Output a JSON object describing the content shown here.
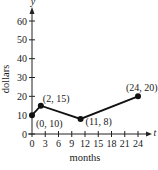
{
  "chart_data": {
    "type": "line",
    "title": "",
    "xlabel": "months",
    "ylabel": "dollars",
    "x_axis_var": "t",
    "y_axis_var": "y",
    "xlim": [
      0,
      24
    ],
    "ylim": [
      0,
      60
    ],
    "x_ticks": [
      0,
      3,
      6,
      9,
      12,
      15,
      18,
      21,
      24
    ],
    "y_ticks": [
      0,
      10,
      20,
      30,
      40,
      50,
      60
    ],
    "grid": false,
    "legend": null,
    "series": [
      {
        "name": "cost",
        "x": [
          0,
          2,
          11,
          24
        ],
        "y": [
          10,
          15,
          8,
          20
        ]
      }
    ],
    "annotations": [
      {
        "text": "(0, 10)",
        "x": 0,
        "y": 10
      },
      {
        "text": "(2, 15)",
        "x": 2,
        "y": 15
      },
      {
        "text": "(11, 8)",
        "x": 11,
        "y": 8
      },
      {
        "text": "(24, 20)",
        "x": 24,
        "y": 20
      }
    ],
    "x_tick_labels": [
      "0",
      "3",
      "6",
      "9",
      "12",
      "15",
      "18",
      "21",
      "24"
    ],
    "y_tick_labels": [
      "0",
      "10",
      "20",
      "30",
      "40",
      "50",
      "60"
    ]
  }
}
